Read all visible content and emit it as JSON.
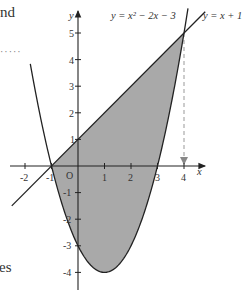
{
  "text_fragments": {
    "top_left": "nd",
    "dots": "·····",
    "bottom_left": "es"
  },
  "chart_data": {
    "type": "line",
    "title": "",
    "xlabel": "x",
    "ylabel": "y",
    "origin_label": "O",
    "xlim": [
      -2.9,
      4.8
    ],
    "ylim": [
      -4.8,
      5.7
    ],
    "x_ticks": [
      "-2",
      "-1",
      "1",
      "2",
      "3",
      "4"
    ],
    "y_ticks": [
      "5",
      "4",
      "3",
      "2",
      "1",
      "-1",
      "-2",
      "-3",
      "-4"
    ],
    "grid": false,
    "series": [
      {
        "name": "y = x² − 2x − 3",
        "label": "y = x² − 2x − 3",
        "kind": "parabola",
        "x_range": [
          -1.8,
          4.15
        ]
      },
      {
        "name": "y = x + 1",
        "label": "y = x + 1",
        "kind": "line",
        "x_range": [
          -2.5,
          4.8
        ]
      }
    ],
    "shaded_region": {
      "between": [
        "y = x + 1",
        "y = x² − 2x − 3"
      ],
      "x_from": -1,
      "x_to": 4,
      "color": "#a9a9a9"
    },
    "intersections": [
      [
        -1,
        0
      ],
      [
        4,
        5
      ]
    ],
    "annotations": [
      {
        "type": "dashed-arrow",
        "from": [
          4,
          5
        ],
        "to": [
          4,
          0
        ]
      }
    ],
    "colors": {
      "curve": "#222222",
      "fill": "#a9a9a9",
      "dashed": "#999999"
    }
  }
}
